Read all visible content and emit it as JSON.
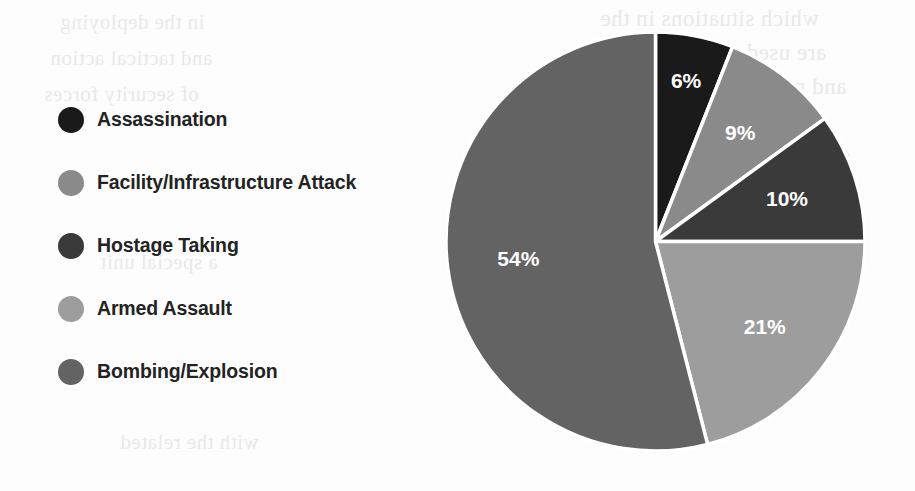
{
  "chart_data": {
    "type": "pie",
    "title": "",
    "xlabel": "",
    "ylabel": "",
    "legend_position": "left",
    "value_unit": "%",
    "start_angle_deg": 0,
    "direction": "clockwise",
    "categories": [
      "Assassination",
      "Facility/Infrastructure Attack",
      "Hostage Taking",
      "Armed Assault",
      "Bombing/Explosion"
    ],
    "values": [
      6,
      9,
      10,
      21,
      54
    ],
    "labels": [
      "6%",
      "9%",
      "10%",
      "21%",
      "54%"
    ],
    "colors": [
      "#1a1a1a",
      "#8a8a8a",
      "#3a3a3a",
      "#9d9d9d",
      "#636363"
    ],
    "slice_separator_color": "#ffffff",
    "label_color": "#ffffff"
  },
  "legend": {
    "items": [
      {
        "label": "Assassination",
        "color": "#1a1a1a"
      },
      {
        "label": "Facility/Infrastructure Attack",
        "color": "#8a8a8a"
      },
      {
        "label": "Hostage Taking",
        "color": "#3a3a3a"
      },
      {
        "label": "Armed Assault",
        "color": "#9d9d9d"
      },
      {
        "label": "Bombing/Explosion",
        "color": "#636363"
      }
    ]
  },
  "background_bleed": {
    "lines": [
      "which situations in the",
      "are used and how they",
      "and more the relation",
      "to counter terrorism",
      "of the operations and",
      "in the deploying",
      "and tactical action",
      "of security forces",
      "a special unit",
      "response to a",
      "with the related"
    ]
  }
}
